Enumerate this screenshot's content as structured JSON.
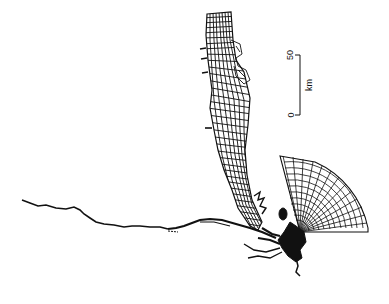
{
  "figure": {
    "stroke_color": "#111111",
    "background": "#ffffff"
  },
  "scale_bar": {
    "top_label": "50",
    "bottom_label": "0",
    "unit_label": "km"
  }
}
